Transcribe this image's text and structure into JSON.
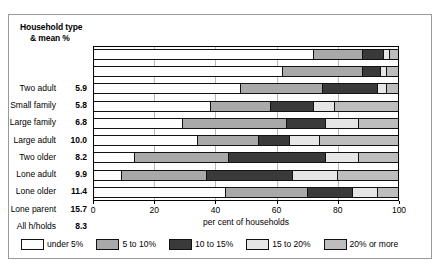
{
  "header": {
    "line1": "Household type",
    "line2": "& mean %"
  },
  "axis": {
    "title": "per cent  of households",
    "ticks": [
      {
        "value": 0,
        "label": "0"
      },
      {
        "value": 20,
        "label": "20"
      },
      {
        "value": 40,
        "label": "40"
      },
      {
        "value": 60,
        "label": "60"
      },
      {
        "value": 80,
        "label": "80"
      },
      {
        "value": 100,
        "label": "100"
      }
    ],
    "min": 0,
    "max": 100
  },
  "legend": [
    {
      "label": "under 5%",
      "color": "#fdfdfd"
    },
    {
      "label": "5 to 10%",
      "color": "#a9a9a9"
    },
    {
      "label": "10 to 15%",
      "color": "#3a3a3a"
    },
    {
      "label": "15 to 20%",
      "color": "#e6e6e6"
    },
    {
      "label": "20% or more",
      "color": "#bdbdbd"
    }
  ],
  "chart_data": {
    "type": "bar",
    "orientation": "horizontal",
    "stacked": true,
    "stack_total": 100,
    "title": "",
    "xlabel": "per cent  of households",
    "ylabel": "Household type & mean %",
    "xlim": [
      0,
      100
    ],
    "grid": true,
    "legend_position": "bottom",
    "categories": [
      "Two adult",
      "Small family",
      "Large family",
      "Large adult",
      "Two older",
      "Lone adult",
      "Lone older",
      "Lone parent",
      "All h/holds"
    ],
    "mean_percent": [
      5.9,
      5.8,
      6.8,
      10.0,
      8.2,
      9.9,
      11.4,
      15.7,
      8.3
    ],
    "series": [
      {
        "name": "under 5%",
        "values": [
          72,
          62,
          48,
          38,
          29,
          34,
          13,
          9,
          43
        ]
      },
      {
        "name": "5 to 10%",
        "values": [
          16,
          26,
          27,
          20,
          34,
          20,
          31,
          28,
          27
        ]
      },
      {
        "name": "10 to 15%",
        "values": [
          7,
          6,
          18,
          14,
          13,
          10,
          32,
          28,
          15
        ]
      },
      {
        "name": "15 to 20%",
        "values": [
          2,
          2,
          3,
          7,
          11,
          10,
          11,
          15,
          8
        ]
      },
      {
        "name": "20% or more",
        "values": [
          3,
          4,
          4,
          21,
          13,
          26,
          13,
          20,
          7
        ]
      }
    ]
  }
}
